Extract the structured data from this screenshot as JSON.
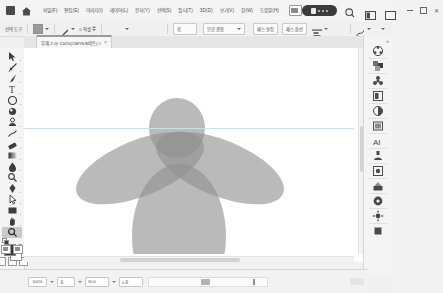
{
  "titlebar": {
    "app_icon": "photoshop-app-icon",
    "home_icon": "home-icon",
    "menus": [
      {
        "label": "파일(F)"
      },
      {
        "label": "편집(E)"
      },
      {
        "label": "이미지(I)"
      },
      {
        "label": "레이어(L)"
      },
      {
        "label": "문자(Y)"
      },
      {
        "label": "선택(S)"
      },
      {
        "label": "필터(T)"
      },
      {
        "label": "3D(D)"
      },
      {
        "label": "보기(V)"
      },
      {
        "label": "창(W)"
      },
      {
        "label": "도움말(H)"
      }
    ],
    "arrange_icon": "arrange-documents-icon",
    "badge_label": "",
    "search_icon": "search-icon",
    "workspace_icon": "workspace-switcher-icon",
    "panel_icon": "panel-toggle-icon",
    "window_controls": {
      "minimize": "minimize-icon",
      "maximize": "maximize-icon",
      "close": "close-icon"
    }
  },
  "optionsbar": {
    "tool_name": "선택 도구",
    "fill_label": "칠",
    "fill_color": "#9b9b9b",
    "stroke_label": "획",
    "stroke_width": "0 픽셀",
    "shape_dropdown": "모양 결합",
    "align_label": "패스 정렬과 분포",
    "arrange_label": "패스 정렬",
    "extra_btn_1": "패스 설정",
    "extra_btn_2": "패스 옵션",
    "path_icon": "path-operations-icon",
    "align_icon": "align-icon"
  },
  "tabbar": {
    "tab": {
      "title": "무제-2 @ 150%(CMYK/8비트) #",
      "close_icon": "close-tab-icon"
    }
  },
  "toolbar": {
    "tools": [
      {
        "name": "move-tool",
        "selected": false
      },
      {
        "name": "lasso-tool",
        "selected": false
      },
      {
        "name": "brush-tool",
        "selected": false
      },
      {
        "name": "type-tool",
        "selected": false
      },
      {
        "name": "ellipse-shape-tool",
        "selected": false
      },
      {
        "name": "eyedropper-tool",
        "selected": false
      },
      {
        "name": "clone-stamp-tool",
        "selected": false
      },
      {
        "name": "healing-brush-tool",
        "selected": false
      },
      {
        "name": "eraser-tool",
        "selected": false
      },
      {
        "name": "gradient-tool",
        "selected": false
      },
      {
        "name": "blur-tool",
        "selected": false
      },
      {
        "name": "dodge-tool",
        "selected": false
      },
      {
        "name": "pen-tool",
        "selected": false
      },
      {
        "name": "path-selection-tool",
        "selected": false
      },
      {
        "name": "rectangle-tool",
        "selected": false
      },
      {
        "name": "hand-tool",
        "selected": false
      },
      {
        "name": "zoom-tool",
        "selected": true
      }
    ],
    "foreground_color": "#3a3a3a",
    "background_color": "#ffffff",
    "swap_colors_icon": "swap-colors-icon",
    "default_colors_icon": "default-colors-icon",
    "quick_mask_icon": "quick-mask-icon",
    "screen_mode_icon": "screen-mode-icon",
    "more_tools_label": "···"
  },
  "canvas": {
    "background": "#ffffff",
    "guide_color": "#bfe3f0",
    "guide_y": 80,
    "artwork": {
      "name": "angel-figure-ellipses",
      "fill": "#8f8f8f",
      "shapes": [
        {
          "name": "head-ellipse",
          "cx": 153,
          "cy": 80,
          "rx": 28,
          "ry": 30,
          "rotate": 0,
          "opacity": 0.62
        },
        {
          "name": "left-wing-ellipse",
          "cx": 116,
          "cy": 120,
          "rx": 68,
          "ry": 28,
          "rotate": -22,
          "opacity": 0.62
        },
        {
          "name": "right-wing-ellipse",
          "cx": 196,
          "cy": 120,
          "rx": 68,
          "ry": 28,
          "rotate": 22,
          "opacity": 0.62
        },
        {
          "name": "body-ellipse",
          "cx": 155,
          "cy": 188,
          "rx": 47,
          "ry": 72,
          "rotate": 0,
          "opacity": 0.62
        }
      ]
    },
    "scrollbars": {
      "vertical": "vertical-scrollbar",
      "horizontal": "horizontal-scrollbar"
    }
  },
  "right_dock": {
    "collapse_icon": "collapse-panels-icon",
    "buttons": [
      {
        "name": "color-panel-icon"
      },
      {
        "name": "swatches-panel-icon"
      },
      {
        "name": "gradients-panel-icon"
      },
      {
        "name": "patterns-panel-icon"
      },
      {
        "name": "adjustments-panel-icon"
      },
      {
        "name": "styles-panel-icon"
      },
      {
        "name": "layers-panel-icon"
      },
      {
        "name": "character-panel-icon"
      },
      {
        "name": "paragraph-panel-icon"
      },
      {
        "name": "properties-panel-icon"
      },
      {
        "name": "libraries-panel-icon"
      },
      {
        "name": "history-panel-icon"
      },
      {
        "name": "actions-panel-icon"
      },
      {
        "name": "info-panel-icon"
      }
    ]
  },
  "statusbar": {
    "zoom_value": "100%",
    "doc_info_1": "초",
    "doc_info_2": "30.0",
    "doc_info_3": "0 초",
    "timeline_label": "",
    "frame_marker": "playhead-marker"
  }
}
